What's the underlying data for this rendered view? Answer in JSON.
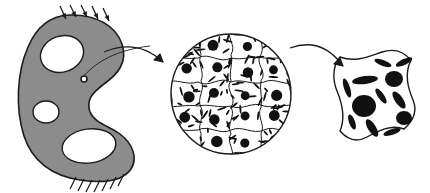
{
  "figure": {
    "description": "A loaded macroscopic perforated structure, a magnified circular representative volume element of tessellated cells, and a single magnified unit cell with elliptical inclusions.",
    "background_color": "#ffffff",
    "line_color": "#1b1b1b",
    "fill_gray": "#8c8c8c",
    "inclusion_color": "#111111"
  },
  "macro": {
    "name": "macroscopic-structure",
    "label": "Macroscopic perforated body",
    "fill_color": "#8c8c8c",
    "outline_color": "#1b1b1b",
    "outline": "M 69 15 C 96 14 116 26 122 44 C 128 62 118 74 104 84 C 92 93 86 100 90 112 C 95 124 110 126 120 134 C 133 144 138 158 131 169 C 122 182 100 183 80 180 C 52 176 32 161 24 136 C 15 108 17 72 28 47 C 36 28 50 16 69 15 Z",
    "holes": [
      {
        "name": "hole-top-ellipse",
        "cx": 62,
        "cy": 54,
        "rx": 22,
        "ry": 18,
        "rotation": -20
      },
      {
        "name": "hole-small-circle",
        "cx": 46,
        "cy": 112,
        "rx": 13,
        "ry": 11,
        "rotation": 0
      },
      {
        "name": "hole-bottom-ellipse",
        "cx": 89,
        "cy": 146,
        "rx": 27,
        "ry": 17,
        "rotation": -8
      }
    ],
    "load": {
      "name": "load-arrows",
      "label": "Applied traction",
      "count": 5,
      "direction": "down-right",
      "arrows": [
        {
          "x1": 60,
          "y1": 6,
          "x2": 66,
          "y2": 19
        },
        {
          "x1": 70,
          "y1": 5,
          "x2": 76,
          "y2": 17
        },
        {
          "x1": 81,
          "y1": 5,
          "x2": 87,
          "y2": 17
        },
        {
          "x1": 92,
          "y1": 6,
          "x2": 98,
          "y2": 19
        },
        {
          "x1": 103,
          "y1": 8,
          "x2": 109,
          "y2": 21
        }
      ]
    },
    "support": {
      "name": "fixed-support-hatching",
      "label": "Fixed boundary",
      "count": 7,
      "base_y": 176,
      "hatches": [
        {
          "x1": 76,
          "y1": 177,
          "x2": 70,
          "y2": 189
        },
        {
          "x1": 84,
          "y1": 179,
          "x2": 78,
          "y2": 191
        },
        {
          "x1": 92,
          "y1": 180,
          "x2": 86,
          "y2": 192
        },
        {
          "x1": 100,
          "y1": 180,
          "x2": 94,
          "y2": 192
        },
        {
          "x1": 108,
          "y1": 179,
          "x2": 102,
          "y2": 191
        },
        {
          "x1": 116,
          "y1": 177,
          "x2": 110,
          "y2": 189
        },
        {
          "x1": 124,
          "y1": 174,
          "x2": 118,
          "y2": 186
        }
      ]
    },
    "point_marker": {
      "name": "material-point-marker",
      "label": "Material point",
      "cx": 84,
      "cy": 79,
      "r": 3,
      "leader": "M 84 76 C 96 62 116 50 150 46"
    }
  },
  "arrows": [
    {
      "name": "zoom-arrow-macro-to-rve",
      "label": "Zoom to representative volume element",
      "path": "M 104 52 C 128 42 148 48 163 62",
      "head": "M 163 62 L 154 60 L 160 54 Z"
    },
    {
      "name": "zoom-arrow-rve-to-cell",
      "label": "Zoom to unit cell",
      "path": "M 290 48 C 312 40 330 48 343 66",
      "head": "M 343 66 L 334 64 L 340 58 Z"
    }
  ],
  "rve": {
    "name": "representative-volume-element",
    "label": "Representative volume element (microstructure)",
    "cx": 231,
    "cy": 94,
    "r": 60,
    "outline_color": "#1b1b1b",
    "cell_count": 20,
    "grid": {
      "columns": 4,
      "rows": 5
    },
    "nucleus_color": "#111111",
    "fiber_color": "#111111"
  },
  "unit_cell": {
    "name": "magnified-unit-cell",
    "label": "Magnified unit cell with inclusions",
    "outline": "M 340 57 C 356 63 370 56 382 52 C 394 48 404 52 411 60 C 404 74 408 88 413 100 C 418 112 412 122 404 129 C 391 124 378 131 367 137 C 356 143 347 139 340 131 C 346 117 342 103 337 91 C 332 79 333 65 340 57 Z",
    "outline_color": "#1b1b1b",
    "inclusion_color": "#111111",
    "inclusions": [
      {
        "name": "inclusion-dot-large",
        "cx": 364,
        "cy": 106,
        "rx": 12,
        "ry": 11,
        "rotation": 0
      },
      {
        "name": "inclusion-dot-1",
        "cx": 394,
        "cy": 79,
        "rx": 9,
        "ry": 8,
        "rotation": 0
      },
      {
        "name": "inclusion-dot-2",
        "cx": 404,
        "cy": 118,
        "rx": 8,
        "ry": 7,
        "rotation": 0
      },
      {
        "name": "inclusion-ellipse-1",
        "cx": 365,
        "cy": 80,
        "rx": 13,
        "ry": 4,
        "rotation": -8
      },
      {
        "name": "inclusion-ellipse-2",
        "cx": 347,
        "cy": 88,
        "rx": 10,
        "ry": 3,
        "rotation": 72
      },
      {
        "name": "inclusion-ellipse-3",
        "cx": 383,
        "cy": 63,
        "rx": 9,
        "ry": 3,
        "rotation": 20
      },
      {
        "name": "inclusion-ellipse-4",
        "cx": 404,
        "cy": 62,
        "rx": 9,
        "ry": 3,
        "rotation": -25
      },
      {
        "name": "inclusion-ellipse-5",
        "cx": 381,
        "cy": 96,
        "rx": 9,
        "ry": 3,
        "rotation": 55
      },
      {
        "name": "inclusion-ellipse-6",
        "cx": 399,
        "cy": 100,
        "rx": 10,
        "ry": 4,
        "rotation": 55
      },
      {
        "name": "inclusion-ellipse-7",
        "cx": 372,
        "cy": 128,
        "rx": 10,
        "ry": 4,
        "rotation": 58
      },
      {
        "name": "inclusion-ellipse-8",
        "cx": 392,
        "cy": 132,
        "rx": 9,
        "ry": 3,
        "rotation": -18
      },
      {
        "name": "inclusion-ellipse-9",
        "cx": 352,
        "cy": 122,
        "rx": 8,
        "ry": 3,
        "rotation": 70
      }
    ]
  }
}
